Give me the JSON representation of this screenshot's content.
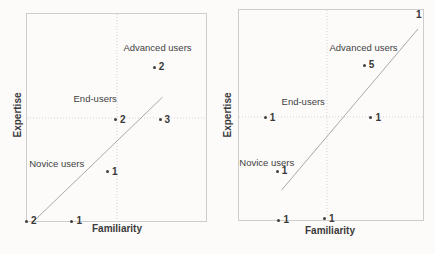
{
  "figure": {
    "description_colors": {
      "text": "#3d3d3d",
      "trend_line": "#a9a9a9",
      "plot_border": "#cdcdcd",
      "gridline": "#d6d4d2",
      "background": "#fcfbfa"
    }
  },
  "chart_data": [
    {
      "type": "scatter",
      "title": "",
      "xlabel": "Familiarity",
      "ylabel": "Expertise",
      "axis_numeric_scale": false,
      "grid": "center dotted crosshair",
      "gridlines": {
        "v_pct": 50.3,
        "h_pct": 50.2
      },
      "trend_line": {
        "x1_pct": 3.9,
        "y1_pct": 100,
        "x2_pct": 75.7,
        "y2_pct": 40.2
      },
      "regions": [
        {
          "label": "Advanced users",
          "x_pct": 72.9,
          "y_pct": 15.8
        },
        {
          "label": "End-users",
          "x_pct": 38.1,
          "y_pct": 40.7
        },
        {
          "label": "Novice users",
          "x_pct": 16.6,
          "y_pct": 72.2
        }
      ],
      "points": [
        {
          "count": "2",
          "x_pct": 71.3,
          "y_pct": 25.8,
          "dot": true
        },
        {
          "count": "2",
          "x_pct": 49.7,
          "y_pct": 51.2,
          "dot": true
        },
        {
          "count": "3",
          "x_pct": 74.6,
          "y_pct": 51.2,
          "dot": true
        },
        {
          "count": "1",
          "x_pct": 45.3,
          "y_pct": 76.1,
          "dot": true
        },
        {
          "count": "2",
          "x_pct": 0.0,
          "y_pct": 100.0,
          "dot": true
        },
        {
          "count": "1",
          "x_pct": 25.4,
          "y_pct": 100.0,
          "dot": true
        }
      ]
    },
    {
      "type": "scatter",
      "title": "",
      "xlabel": "Familiarity",
      "ylabel": "Expertise",
      "axis_numeric_scale": false,
      "grid": "center dotted crosshair",
      "gridlines": {
        "v_pct": 47.8,
        "h_pct": 50.9
      },
      "trend_line": {
        "x1_pct": 23.1,
        "y1_pct": 85.8,
        "x2_pct": 97.3,
        "y2_pct": 9.0
      },
      "regions": [
        {
          "label": "Advanced users",
          "x_pct": 67.7,
          "y_pct": 17.5
        },
        {
          "label": "End-users",
          "x_pct": 34.9,
          "y_pct": 43.4
        },
        {
          "label": "Novice users",
          "x_pct": 15.1,
          "y_pct": 72.2
        }
      ],
      "points": [
        {
          "count": "1",
          "x_pct": 97.3,
          "y_pct": 2.4,
          "dot": false
        },
        {
          "count": "5",
          "x_pct": 68.3,
          "y_pct": 26.4,
          "dot": true
        },
        {
          "count": "1",
          "x_pct": 14.5,
          "y_pct": 51.4,
          "dot": true
        },
        {
          "count": "1",
          "x_pct": 72.0,
          "y_pct": 51.4,
          "dot": true
        },
        {
          "count": "1",
          "x_pct": 21.0,
          "y_pct": 76.9,
          "dot": true
        },
        {
          "count": "1",
          "x_pct": 22.0,
          "y_pct": 100.0,
          "dot": true
        },
        {
          "count": "1",
          "x_pct": 46.8,
          "y_pct": 99.5,
          "dot": true
        }
      ]
    }
  ]
}
